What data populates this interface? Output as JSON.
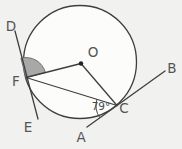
{
  "figure": {
    "colors": {
      "background": "#f1f1ef",
      "circle_fill": "#fcfcfb",
      "stroke": "#3f3f3f",
      "label": "#555555",
      "shade_fill": "#a8a8a8",
      "shade_stroke": "#6f6f6f"
    },
    "canvas": {
      "viewBox": "0 0 182 149",
      "width": "182",
      "height": "149"
    },
    "bg_rect": {
      "x": 0,
      "y": 0,
      "width": 182,
      "height": 149,
      "fill": "#f1f1ef"
    },
    "circle": {
      "cx": 80,
      "cy": 62,
      "r": 56.5,
      "fill": "#fcfcfb",
      "stroke": "#3f3f3f",
      "stroke-width": 1.3
    },
    "center_dot": {
      "cx": 81,
      "cy": 63.5,
      "r": 2.2,
      "fill": "#222222"
    },
    "shade_sector": {
      "d": "M 26 77.5 L 20.9 58.2 A 20 20 0 0 1 45.3 72.4 Z",
      "fill": "#a8a8a8",
      "stroke": "#6f6f6f",
      "stroke-width": 1
    },
    "lines": {
      "tangent_DE": {
        "x1": 15,
        "y1": 31,
        "x2": 38,
        "y2": 119,
        "stroke": "#3f3f3f",
        "stroke-width": 1.3,
        "stroke-linecap": "round"
      },
      "tangent_BA": {
        "x1": 165,
        "y1": 71,
        "x2": 87,
        "y2": 127,
        "stroke": "#3f3f3f",
        "stroke-width": 1.3,
        "stroke-linecap": "round"
      },
      "radius_OF": {
        "x1": 81,
        "y1": 63.5,
        "x2": 26,
        "y2": 77.5,
        "stroke": "#3f3f3f",
        "stroke-width": 1.3,
        "stroke-linecap": "round"
      },
      "radius_OC": {
        "x1": 81,
        "y1": 63.5,
        "x2": 117,
        "y2": 105.5,
        "stroke": "#3f3f3f",
        "stroke-width": 1.3,
        "stroke-linecap": "round"
      },
      "chord_FC": {
        "x1": 26,
        "y1": 77.5,
        "x2": 117,
        "y2": 105.5,
        "stroke": "#3f3f3f",
        "stroke-width": 1.3,
        "stroke-linecap": "round"
      }
    },
    "angle_arc": {
      "d": "M 99.9 117.7 A 21 21 0 0 1 96.9 99.4",
      "fill": "none",
      "stroke": "#4a4a4a",
      "stroke-width": 1
    },
    "labels": {
      "D": {
        "text": "D",
        "pos": {
          "x": 11,
          "y": 31,
          "font-size": "13.5",
          "fill": "#555555"
        }
      },
      "F": {
        "text": "F",
        "pos": {
          "x": 16,
          "y": 86,
          "font-size": "13.5",
          "fill": "#555555"
        }
      },
      "E": {
        "text": "E",
        "pos": {
          "x": 28,
          "y": 132,
          "font-size": "13.5",
          "fill": "#555555"
        }
      },
      "O": {
        "text": "O",
        "pos": {
          "x": 93,
          "y": 57,
          "font-size": "13.5",
          "fill": "#555555"
        }
      },
      "B": {
        "text": "B",
        "pos": {
          "x": 172,
          "y": 73,
          "font-size": "13.5",
          "fill": "#555555"
        }
      },
      "C": {
        "text": "C",
        "pos": {
          "x": 124,
          "y": 113,
          "font-size": "13.5",
          "fill": "#555555"
        }
      },
      "A": {
        "text": "A",
        "pos": {
          "x": 81,
          "y": 142,
          "font-size": "13.5",
          "fill": "#555555"
        }
      },
      "angle": {
        "text": "79°",
        "pos": {
          "x": 101,
          "y": 110,
          "font-size": "10.5",
          "fill": "#4a4a4a"
        }
      }
    }
  }
}
